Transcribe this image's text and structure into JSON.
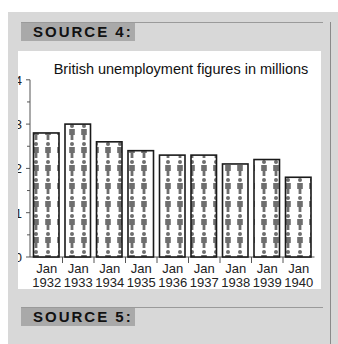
{
  "sources": [
    {
      "label": "SOURCE 4:"
    },
    {
      "label": "SOURCE 5:"
    }
  ],
  "chart_data": {
    "type": "bar",
    "title": "British unemployment figures in millions",
    "xlabel": "",
    "ylabel": "",
    "categories": [
      "Jan 1932",
      "Jan 1933",
      "Jan 1934",
      "Jan 1935",
      "Jan 1936",
      "Jan 1937",
      "Jan 1938",
      "Jan 1939",
      "Jan 1940"
    ],
    "category_lines": [
      [
        "Jan",
        "1932"
      ],
      [
        "Jan",
        "1933"
      ],
      [
        "Jan",
        "1934"
      ],
      [
        "Jan",
        "1935"
      ],
      [
        "Jan",
        "1936"
      ],
      [
        "Jan",
        "1937"
      ],
      [
        "Jan",
        "1938"
      ],
      [
        "Jan",
        "1939"
      ],
      [
        "Jan",
        "1940"
      ]
    ],
    "values": [
      2.8,
      3.0,
      2.6,
      2.4,
      2.3,
      2.3,
      2.1,
      2.2,
      1.8
    ],
    "ylim": [
      0,
      4
    ],
    "yticks": [
      0,
      1,
      2,
      3,
      4
    ],
    "grid": false,
    "legend": null,
    "bar_style": "pictogram of people figures",
    "colors": {
      "figure": "#6e6e6e",
      "bar_border": "#1a1a1a",
      "axis": "#555555"
    }
  }
}
